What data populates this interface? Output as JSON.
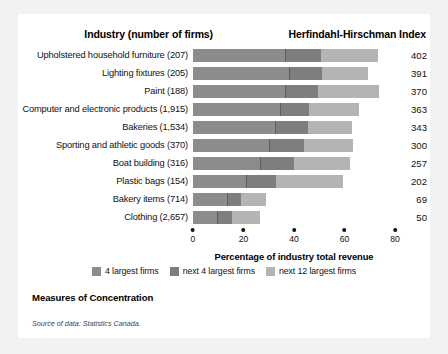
{
  "header": {
    "industry_label": "Industry (number of firms)",
    "hhi_label": "Herfindahl-Hirschman Index"
  },
  "caption": "Measures of Concentration",
  "source": "Source of data: Statistics Canada.",
  "legend": [
    {
      "label": "4 largest firms",
      "color": "#8c8c8c"
    },
    {
      "label": "next 4 largest firms",
      "color": "#7e7e7e"
    },
    {
      "label": "next 12 largest firms",
      "color": "#b4b4b4"
    }
  ],
  "chart_data": {
    "type": "bar",
    "orientation": "horizontal",
    "stacked": true,
    "title": "Measures of Concentration",
    "xlabel": "Percentage of industry total revenue",
    "ylabel": "Industry (number of firms)",
    "xlim": [
      0,
      80
    ],
    "xticks": [
      0,
      20,
      40,
      60,
      80
    ],
    "grid": false,
    "legend_position": "bottom",
    "categories": [
      "Upholstered household furniture  (207)",
      "Lighting fixtures  (205)",
      "Paint  (188)",
      "Computer and electronic products  (1,915)",
      "Bakeries  (1,534)",
      "Sporting and athletic goods  (370)",
      "Boat building (316)",
      "Plastic bags  (154)",
      "Bakery items (714)",
      "Clothing  (2,657)"
    ],
    "series": [
      {
        "name": "4 largest firms",
        "values": [
          36.5,
          38.0,
          36.5,
          34.5,
          32.5,
          30.0,
          26.5,
          21.0,
          13.5,
          9.5
        ]
      },
      {
        "name": "next 4 largest firms",
        "values": [
          14.0,
          13.0,
          13.0,
          11.5,
          13.0,
          14.0,
          13.5,
          12.0,
          5.5,
          6.0
        ]
      },
      {
        "name": "next 12 largest firms",
        "values": [
          22.9,
          18.5,
          24.0,
          19.8,
          17.3,
          19.2,
          22.3,
          26.6,
          10.1,
          11.0
        ]
      }
    ],
    "annotations": [
      {
        "category": "Upholstered household furniture  (207)",
        "hhi": 402
      },
      {
        "category": "Lighting fixtures  (205)",
        "hhi": 391
      },
      {
        "category": "Paint  (188)",
        "hhi": 370
      },
      {
        "category": "Computer and electronic products  (1,915)",
        "hhi": 363
      },
      {
        "category": "Bakeries  (1,534)",
        "hhi": 343
      },
      {
        "category": "Sporting and athletic goods  (370)",
        "hhi": 300
      },
      {
        "category": "Boat building (316)",
        "hhi": 257
      },
      {
        "category": "Plastic bags  (154)",
        "hhi": 202
      },
      {
        "category": "Bakery items (714)",
        "hhi": 69
      },
      {
        "category": "Clothing  (2,657)",
        "hhi": 50
      }
    ]
  }
}
